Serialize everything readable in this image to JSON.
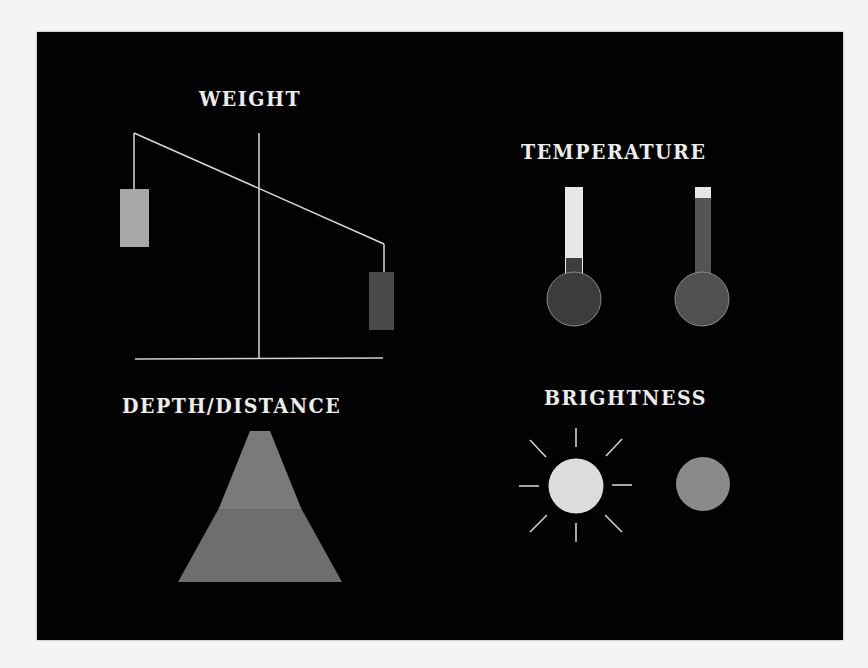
{
  "figure": {
    "background": "#020202",
    "page_background": "#f4f4f4",
    "line_color": "#d8d8d8"
  },
  "sections": {
    "weight": {
      "title": "WEIGHT",
      "light_weight_color": "#a8a8a8",
      "heavy_weight_color": "#4a4a4a"
    },
    "temperature": {
      "title": "TEMPERATURE",
      "thermometers": [
        {
          "id": "cold",
          "fill_color": "#3e3e3e",
          "tube_empty_color": "#e6e6e6",
          "fill_level": "low"
        },
        {
          "id": "hot",
          "fill_color": "#545454",
          "tube_empty_color": "#e6e6e6",
          "fill_level": "high"
        }
      ]
    },
    "depth_distance": {
      "title": "DEPTH/DISTANCE",
      "near_band_color": "#6e6e6e",
      "far_band_color": "#7a7a7a"
    },
    "brightness": {
      "title": "BRIGHTNESS",
      "bright_color": "#dcdcdc",
      "dim_color": "#8a8a8a",
      "ray_count": 8
    }
  }
}
